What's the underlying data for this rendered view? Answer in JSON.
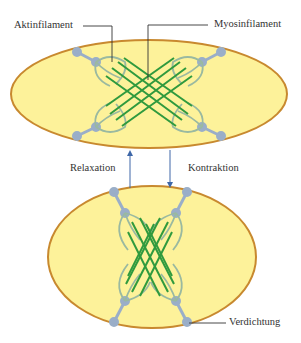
{
  "labels": {
    "actin": "Aktinfilament",
    "myosin": "Myosinfilament",
    "relaxation": "Relaxation",
    "contraction": "Kontraktion",
    "densification": "Verdichtung"
  },
  "colors": {
    "cell_fill": "#fdf29a",
    "cell_border": "#c8892f",
    "myosin": "#2f9a3e",
    "actin": "#9ab9a0",
    "dense_body": "#9aaec8",
    "arrow": "#3e67a8",
    "leader": "#333333"
  },
  "states": [
    {
      "name": "relaxed",
      "shape": "elongated ellipse"
    },
    {
      "name": "contracted",
      "shape": "rounded ellipse"
    }
  ]
}
